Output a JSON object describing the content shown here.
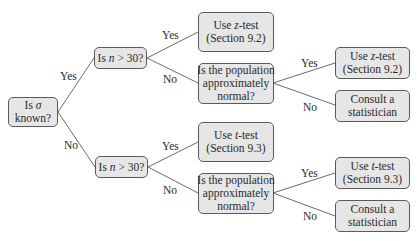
{
  "diagram": {
    "type": "decision-tree",
    "nodes": {
      "root": {
        "line1": "Is σ",
        "line2": "known?"
      },
      "n_top": {
        "text": "Is n > 30?"
      },
      "n_bottom": {
        "text": "Is n > 30?"
      },
      "z_test_1": {
        "line1": "Use z-test",
        "line2": "(Section 9.2)"
      },
      "normal_top": {
        "line1": "Is the population",
        "line2": "approximately",
        "line3": "normal?"
      },
      "z_test_2": {
        "line1": "Use z-test",
        "line2": "(Section 9.2)"
      },
      "consult_top": {
        "line1": "Consult a",
        "line2": "statistician"
      },
      "t_test_1": {
        "line1": "Use t-test",
        "line2": "(Section 9.3)"
      },
      "normal_bottom": {
        "line1": "Is the population",
        "line2": "approximately",
        "line3": "normal?"
      },
      "t_test_2": {
        "line1": "Use t-test",
        "line2": "(Section 9.3)"
      },
      "consult_bottom": {
        "line1": "Consult a",
        "line2": "statistician"
      }
    },
    "edges": {
      "root_yes": "Yes",
      "root_no": "No",
      "n_top_yes": "Yes",
      "n_top_no": "No",
      "normal_top_yes": "Yes",
      "normal_top_no": "No",
      "n_bottom_yes": "Yes",
      "n_bottom_no": "No",
      "normal_bottom_yes": "Yes",
      "normal_bottom_no": "No"
    },
    "colors": {
      "node_fill": "#e6e6e6",
      "node_border": "#5a5a5a",
      "edge": "#5a5a5a",
      "text": "#2a2a2a"
    }
  }
}
